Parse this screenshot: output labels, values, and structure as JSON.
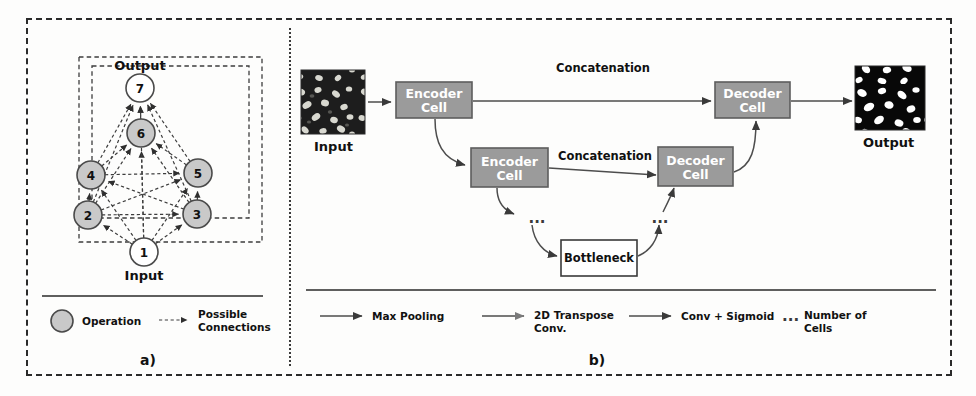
{
  "figure": {
    "panels": [
      {
        "id": "a",
        "caption": "a)",
        "top_label": "Output",
        "bottom_label": "Input",
        "nodes": [
          {
            "id": "1",
            "label": "1",
            "type": "input",
            "x": 144,
            "y": 252
          },
          {
            "id": "2",
            "label": "2",
            "type": "operation",
            "x": 88,
            "y": 215
          },
          {
            "id": "3",
            "label": "3",
            "type": "operation",
            "x": 197,
            "y": 214
          },
          {
            "id": "4",
            "label": "4",
            "type": "operation",
            "x": 91,
            "y": 175
          },
          {
            "id": "5",
            "label": "5",
            "type": "operation",
            "x": 198,
            "y": 173
          },
          {
            "id": "6",
            "label": "6",
            "type": "operation",
            "x": 141,
            "y": 133
          },
          {
            "id": "7",
            "label": "7",
            "type": "output",
            "x": 140,
            "y": 88
          }
        ],
        "edges": [
          [
            "1",
            "2"
          ],
          [
            "1",
            "3"
          ],
          [
            "1",
            "4"
          ],
          [
            "1",
            "5"
          ],
          [
            "1",
            "6"
          ],
          [
            "1",
            "7"
          ],
          [
            "2",
            "3"
          ],
          [
            "2",
            "4"
          ],
          [
            "2",
            "5"
          ],
          [
            "2",
            "6"
          ],
          [
            "2",
            "7"
          ],
          [
            "3",
            "4"
          ],
          [
            "3",
            "5"
          ],
          [
            "3",
            "6"
          ],
          [
            "3",
            "7"
          ],
          [
            "4",
            "5"
          ],
          [
            "4",
            "6"
          ],
          [
            "4",
            "7"
          ],
          [
            "5",
            "6"
          ],
          [
            "5",
            "7"
          ],
          [
            "6",
            "7"
          ]
        ],
        "legend": [
          {
            "icon": "filled-circle",
            "label": "Operation"
          },
          {
            "icon": "dashed-arrow",
            "label": "Possible\nConnections",
            "line1": "Possible",
            "line2": "Connections"
          }
        ]
      },
      {
        "id": "b",
        "caption": "b)",
        "input_label": "Input",
        "output_label": "Output",
        "boxes": [
          {
            "name": "encoder-cell-1",
            "line1": "Encoder",
            "line2": "Cell",
            "x": 396,
            "y": 82,
            "w": 76,
            "h": 36,
            "style": "gray"
          },
          {
            "name": "encoder-cell-2",
            "line1": "Encoder",
            "line2": "Cell",
            "x": 471,
            "y": 148,
            "w": 77,
            "h": 39,
            "style": "gray"
          },
          {
            "name": "decoder-cell-1",
            "line1": "Decoder",
            "line2": "Cell",
            "x": 715,
            "y": 82,
            "w": 75,
            "h": 36,
            "style": "gray"
          },
          {
            "name": "decoder-cell-2",
            "line1": "Decoder",
            "line2": "Cell",
            "x": 658,
            "y": 147,
            "w": 75,
            "h": 39,
            "style": "gray"
          },
          {
            "name": "bottleneck",
            "line1": "Bottleneck",
            "line2": "",
            "x": 561,
            "y": 240,
            "w": 76,
            "h": 36,
            "style": "white"
          }
        ],
        "edge_labels": [
          {
            "name": "concatenation-top",
            "text": "Concatenation",
            "x": 603,
            "y": 72
          },
          {
            "name": "concatenation-middle",
            "text": "Concatenation",
            "x": 605,
            "y": 160
          }
        ],
        "ellipses": [
          {
            "name": "ellipsis-encoder",
            "text": "...",
            "x": 537,
            "y": 218
          },
          {
            "name": "ellipsis-decoder",
            "text": "...",
            "x": 660,
            "y": 218
          }
        ],
        "legend": [
          {
            "icon": "solid-arrow-dark",
            "label": "Max Pooling",
            "line1": "Max Pooling",
            "line2": ""
          },
          {
            "icon": "solid-arrow-gray",
            "label": "2D Transpose Conv.",
            "line1": "2D Transpose",
            "line2": "Conv."
          },
          {
            "icon": "solid-arrow-dark",
            "label": "Conv + Sigmoid",
            "line1": "Conv + Sigmoid",
            "line2": ""
          },
          {
            "icon": "ellipsis",
            "label": "Number of Cells",
            "line1": "Number of",
            "line2": "Cells"
          }
        ]
      }
    ]
  },
  "colors": {
    "operation_node_fill": "#c9c9c9",
    "io_node_fill": "#ffffff",
    "cell_box_fill": "#9b9b9b",
    "cell_box_text": "#ffffff",
    "bottleneck_fill": "#ffffff",
    "border": "#2a2a2a",
    "edge": "#3d3d3d",
    "arrow": "#4d4d4d"
  }
}
